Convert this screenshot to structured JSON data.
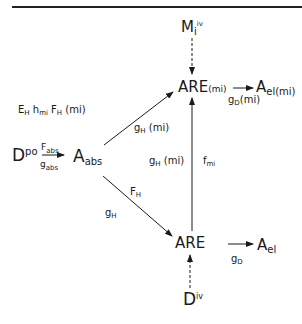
{
  "diagram": {
    "nodes": {
      "mi_iv": {
        "base": "M",
        "sub": "i",
        "sup": "iv"
      },
      "are_mi": {
        "base": "ARE",
        "suffix": "(mi)"
      },
      "ael_mi": {
        "base": "A",
        "sub": "el(mi)"
      },
      "d_po": {
        "base": "D",
        "sup": "po"
      },
      "a_abs": {
        "base": "A",
        "sub": "abs"
      },
      "are": {
        "base": "ARE"
      },
      "ael": {
        "base": "A",
        "sub": "el"
      },
      "d_iv": {
        "base": "D",
        "sup": "iv"
      }
    },
    "edge_labels": {
      "f_abs": {
        "base": "F",
        "sub": "abs"
      },
      "g_abs": {
        "base": "g",
        "sub": "abs"
      },
      "eh_hmi_fh_mi": {
        "e": "E",
        "e_sub": "H",
        "h": "h",
        "h_sub": "mi",
        "f": "F",
        "f_sub": "H",
        "suffix": "(mi)"
      },
      "gh_mi_diag": {
        "base": "g",
        "sub": "H",
        "suffix": "(mi)"
      },
      "gh_mi_mid": {
        "base": "g",
        "sub": "H",
        "suffix": "(mi)"
      },
      "f_mi": {
        "base": "f",
        "sub": "mi"
      },
      "gd_mi": {
        "base": "g",
        "sub": "D",
        "suffix": "(mi)"
      },
      "f_h": {
        "base": "F",
        "sub": "H"
      },
      "g_h": {
        "base": "g",
        "sub": "H"
      },
      "g_d": {
        "base": "g",
        "sub": "D"
      }
    },
    "colors": {
      "ink": "#1a1a1a",
      "background": "#ffffff"
    }
  }
}
